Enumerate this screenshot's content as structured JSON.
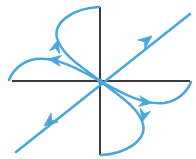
{
  "figure": {
    "name": "phase-portrait",
    "title": "Saddle point phase portrait",
    "width": 196,
    "height": 159,
    "background_color": "#ffffff"
  },
  "colors": {
    "axis": "#3a3a3c",
    "trajectory": "#49a6dc",
    "trajectory_light": "#7cc3e8",
    "background": "#ffffff"
  },
  "axes": {
    "origin": {
      "x": 100,
      "y": 81
    },
    "x_axis": {
      "label": "",
      "x1": 12,
      "y1": 81,
      "x2": 190,
      "y2": 81,
      "stroke_width": 2
    },
    "y_axis": {
      "label": "",
      "x1": 100,
      "y1": 7,
      "x2": 100,
      "y2": 155,
      "stroke_width": 2
    }
  },
  "chart_data": {
    "type": "scatter",
    "title": "Saddle point phase portrait",
    "subtitle": "",
    "xlabel": "",
    "ylabel": "",
    "grid": false,
    "legend": false,
    "equilibrium": {
      "type": "saddle",
      "x": 0,
      "y": 0
    },
    "separatrices": [
      {
        "name": "unstable-separatrix-ne-sw",
        "description": "straight line through origin, slope negative in screen coords, arrows point outward away from origin",
        "stability": "unstable",
        "points": [
          [
            16,
            152
          ],
          [
            190,
            14
          ]
        ],
        "arrows": [
          {
            "x": 150,
            "y": 38,
            "direction": "up-right",
            "angle_deg": -38
          },
          {
            "x": 46,
            "y": 124,
            "direction": "down-left",
            "angle_deg": 142
          }
        ]
      }
    ],
    "trajectories": [
      {
        "name": "upper-left-rising-curve",
        "description": "curve leaving origin toward upper-left then bending up toward top of y-axis",
        "path": [
          [
            100,
            81
          ],
          [
            72,
            58
          ],
          [
            58,
            42
          ],
          [
            56,
            26
          ],
          [
            68,
            14
          ],
          [
            86,
            8
          ],
          [
            98,
            7
          ]
        ],
        "arrows": [
          {
            "x": 58,
            "y": 48,
            "direction": "up",
            "angle_deg": -70
          }
        ]
      },
      {
        "name": "upper-left-flattening-curve",
        "description": "curve leaving origin toward upper-left then flattening out along negative x-axis",
        "path": [
          [
            100,
            81
          ],
          [
            78,
            70
          ],
          [
            60,
            62
          ],
          [
            42,
            58
          ],
          [
            24,
            62
          ],
          [
            12,
            73
          ],
          [
            9,
            80
          ]
        ],
        "arrows": [
          {
            "x": 54,
            "y": 60,
            "direction": "left",
            "angle_deg": 190
          }
        ]
      },
      {
        "name": "lower-right-falling-curve",
        "description": "curve leaving origin toward lower-right then bending down toward bottom of y-axis",
        "path": [
          [
            100,
            81
          ],
          [
            128,
            104
          ],
          [
            142,
            120
          ],
          [
            144,
            136
          ],
          [
            132,
            148
          ],
          [
            114,
            154
          ],
          [
            102,
            155
          ]
        ],
        "arrows": [
          {
            "x": 142,
            "y": 114,
            "direction": "down",
            "angle_deg": 110
          }
        ]
      },
      {
        "name": "lower-right-flattening-curve",
        "description": "curve leaving origin toward lower-right then flattening out along positive x-axis",
        "path": [
          [
            100,
            81
          ],
          [
            122,
            92
          ],
          [
            140,
            100
          ],
          [
            158,
            104
          ],
          [
            176,
            100
          ],
          [
            188,
            89
          ],
          [
            191,
            82
          ]
        ],
        "arrows": [
          {
            "x": 146,
            "y": 102,
            "direction": "right",
            "angle_deg": 10
          }
        ]
      }
    ],
    "arrow_count": 6
  }
}
